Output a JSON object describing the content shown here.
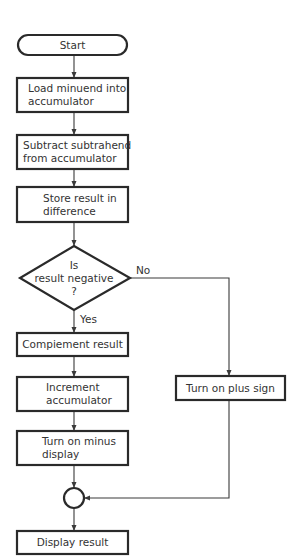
{
  "flowchart": {
    "nodes": {
      "start": {
        "type": "terminal",
        "lines": [
          "Start"
        ]
      },
      "load": {
        "type": "process",
        "lines": [
          "Load minuend into",
          "accumulator"
        ]
      },
      "subtract": {
        "type": "process",
        "lines": [
          "Subtract subtrahend",
          "from accumulator"
        ]
      },
      "store": {
        "type": "process",
        "lines": [
          "Store result in",
          "difference"
        ]
      },
      "decision": {
        "type": "decision",
        "lines": [
          "Is",
          "result negative",
          "?"
        ]
      },
      "complement": {
        "type": "process",
        "lines": [
          "Compiement result"
        ]
      },
      "increment": {
        "type": "process",
        "lines": [
          "Increment",
          "accumulator"
        ]
      },
      "minus": {
        "type": "process",
        "lines": [
          "Turn on minus",
          "display"
        ]
      },
      "plus": {
        "type": "process",
        "lines": [
          "Turn on plus sign"
        ]
      },
      "connector": {
        "type": "connector",
        "lines": []
      },
      "display": {
        "type": "process",
        "lines": [
          "Display result"
        ]
      }
    },
    "edges": [
      {
        "from": "start",
        "to": "load",
        "label": ""
      },
      {
        "from": "load",
        "to": "subtract",
        "label": ""
      },
      {
        "from": "subtract",
        "to": "store",
        "label": ""
      },
      {
        "from": "store",
        "to": "decision",
        "label": ""
      },
      {
        "from": "decision",
        "to": "complement",
        "label": "Yes"
      },
      {
        "from": "decision",
        "to": "plus",
        "label": "No"
      },
      {
        "from": "complement",
        "to": "increment",
        "label": ""
      },
      {
        "from": "increment",
        "to": "minus",
        "label": ""
      },
      {
        "from": "minus",
        "to": "connector",
        "label": ""
      },
      {
        "from": "plus",
        "to": "connector",
        "label": ""
      },
      {
        "from": "connector",
        "to": "display",
        "label": ""
      }
    ],
    "branch_labels": {
      "yes": "Yes",
      "no": "No"
    }
  }
}
